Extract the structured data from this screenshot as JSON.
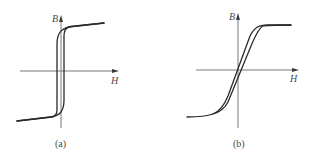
{
  "figure": {
    "panels": [
      {
        "id": "a",
        "caption": "(a)",
        "x_axis_label": "H",
        "y_axis_label": "B",
        "description": "Narrow, nearly rectangular hysteresis loop (soft/square magnetic material) with steep vertical transition and sloped saturation tails"
      },
      {
        "id": "b",
        "caption": "(b)",
        "x_axis_label": "H",
        "y_axis_label": "B",
        "description": "Slanted, narrow hysteresis loop with gradual linear rise and flat saturation plateaus"
      }
    ]
  },
  "colors": {
    "curve": "#2a2a2a",
    "axis": "#6a6a6a",
    "text": "#4a4a4a",
    "background": "#ffffff"
  }
}
